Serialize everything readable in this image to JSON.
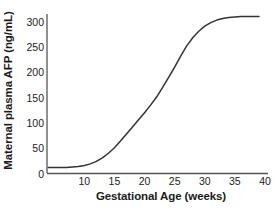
{
  "chart_data": {
    "type": "line",
    "title": "",
    "xlabel": "Gestational Age (weeks)",
    "ylabel": "Maternal plasma AFP (ng/mL)",
    "xlim": [
      3.8,
      40.5
    ],
    "ylim": [
      0,
      315
    ],
    "xticks": [
      10,
      15,
      20,
      25,
      30,
      35,
      40
    ],
    "xtick_labels": [
      "10",
      "15",
      "20",
      "25",
      "30",
      "35",
      "40"
    ],
    "yticks": [
      0,
      50,
      100,
      150,
      200,
      250,
      300
    ],
    "ytick_labels": [
      "0",
      "50",
      "100",
      "150",
      "200",
      "250",
      "300"
    ],
    "grid": false,
    "legend": false,
    "line_color": "#333333",
    "axis_color": "#555555",
    "background_color": "#ffffff",
    "series": [
      {
        "name": "Maternal plasma AFP",
        "x": [
          4,
          5,
          6,
          7,
          8,
          9,
          10,
          11,
          12,
          13,
          14,
          15,
          16,
          17,
          18,
          19,
          20,
          21,
          22,
          23,
          24,
          25,
          26,
          27,
          28,
          29,
          30,
          31,
          32,
          33,
          34,
          35,
          36,
          37,
          38,
          39
        ],
        "values": [
          12,
          12,
          12,
          12,
          13,
          14,
          16,
          19,
          24,
          31,
          40,
          51,
          64,
          78,
          92,
          106,
          120,
          135,
          151,
          170,
          190,
          210,
          232,
          252,
          268,
          281,
          291,
          298,
          303,
          306,
          308,
          309,
          310,
          310,
          310,
          310
        ]
      }
    ]
  }
}
